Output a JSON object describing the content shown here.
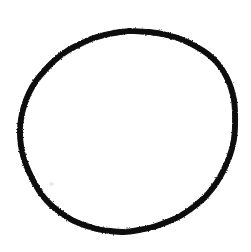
{
  "canvas": {
    "width": 251,
    "height": 252,
    "background_color": "#ffffff",
    "alt_text": "Hand-drawn circle"
  },
  "drawing": {
    "kind": "freehand-sketch",
    "shape_name": "circle",
    "stroke_color": "#0d0d0d",
    "stroke_width_px": 5,
    "closed": true,
    "bounds": {
      "x_min": 20,
      "x_max": 236,
      "y_min": 31,
      "y_max": 232
    },
    "center": {
      "x": 128,
      "y": 131
    },
    "radius_x": 108,
    "radius_y": 100,
    "outline_points": [
      [
        130,
        31
      ],
      [
        149,
        32
      ],
      [
        167,
        35
      ],
      [
        183,
        40
      ],
      [
        197,
        47
      ],
      [
        209,
        55
      ],
      [
        219,
        65
      ],
      [
        226,
        76
      ],
      [
        231,
        88
      ],
      [
        234,
        100
      ],
      [
        235,
        113
      ],
      [
        235,
        126
      ],
      [
        234,
        139
      ],
      [
        231,
        152
      ],
      [
        226,
        165
      ],
      [
        220,
        177
      ],
      [
        212,
        189
      ],
      [
        203,
        199
      ],
      [
        192,
        208
      ],
      [
        180,
        216
      ],
      [
        167,
        222
      ],
      [
        153,
        227
      ],
      [
        139,
        230
      ],
      [
        124,
        232
      ],
      [
        110,
        231
      ],
      [
        97,
        229
      ],
      [
        84,
        225
      ],
      [
        72,
        220
      ],
      [
        61,
        213
      ],
      [
        51,
        205
      ],
      [
        42,
        195
      ],
      [
        35,
        184
      ],
      [
        29,
        172
      ],
      [
        24,
        159
      ],
      [
        21,
        146
      ],
      [
        20,
        132
      ],
      [
        21,
        119
      ],
      [
        24,
        106
      ],
      [
        29,
        93
      ],
      [
        36,
        81
      ],
      [
        45,
        70
      ],
      [
        55,
        60
      ],
      [
        67,
        51
      ],
      [
        80,
        44
      ],
      [
        94,
        38
      ],
      [
        109,
        34
      ],
      [
        120,
        32
      ],
      [
        130,
        31
      ]
    ]
  },
  "marks": [
    {
      "name": "pencil-smudge",
      "x": 49,
      "y": 182,
      "width": 5,
      "height": 4,
      "color": "#b9b9b9",
      "opacity": 0.3
    }
  ]
}
